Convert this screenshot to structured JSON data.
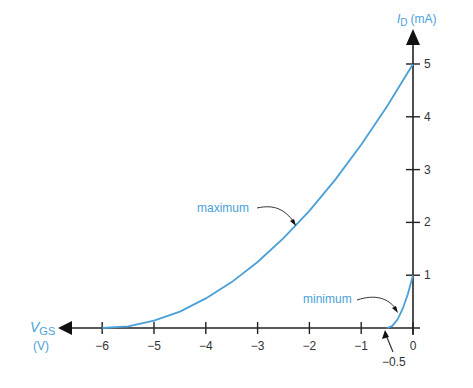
{
  "chart_data": {
    "type": "line",
    "xlabel": "V_GS (V)",
    "ylabel": "I_D (mA)",
    "xlabel_main": "V",
    "xlabel_sub": "GS",
    "xlabel_unit": "(V)",
    "ylabel_main": "I",
    "ylabel_sub": "D",
    "ylabel_unit": "(mA)",
    "xlim": [
      -6.5,
      0
    ],
    "ylim": [
      0,
      5.5
    ],
    "x_ticks": [
      -6,
      -5,
      -4,
      -3,
      -2,
      -1,
      0
    ],
    "x_tick_labels": [
      "−6",
      "−5",
      "−4",
      "−3",
      "−2",
      "−1",
      "0"
    ],
    "y_ticks": [
      1,
      2,
      3,
      4,
      5
    ],
    "y_tick_labels": [
      "1",
      "2",
      "3",
      "4",
      "5"
    ],
    "grid": false,
    "series": [
      {
        "name": "maximum",
        "color": "#4a9fd8",
        "x": [
          -6,
          -5.5,
          -5,
          -4.5,
          -4,
          -3.5,
          -3,
          -2.5,
          -2,
          -1.5,
          -1,
          -0.5,
          0
        ],
        "y": [
          0,
          0.03,
          0.14,
          0.31,
          0.56,
          0.87,
          1.25,
          1.7,
          2.22,
          2.81,
          3.47,
          4.2,
          5.0
        ]
      },
      {
        "name": "minimum",
        "color": "#4a9fd8",
        "x": [
          -0.5,
          -0.4,
          -0.3,
          -0.2,
          -0.1,
          0
        ],
        "y": [
          0,
          0.04,
          0.16,
          0.36,
          0.64,
          1.0
        ]
      }
    ],
    "annotations": [
      {
        "text": "maximum",
        "points_to_x": -2.3,
        "points_to_y": 2.0
      },
      {
        "text": "minimum",
        "points_to_x": -0.25,
        "points_to_y": 0.3
      },
      {
        "text": "−0.5",
        "points_to_x": -0.5,
        "points_to_y": 0
      }
    ]
  }
}
